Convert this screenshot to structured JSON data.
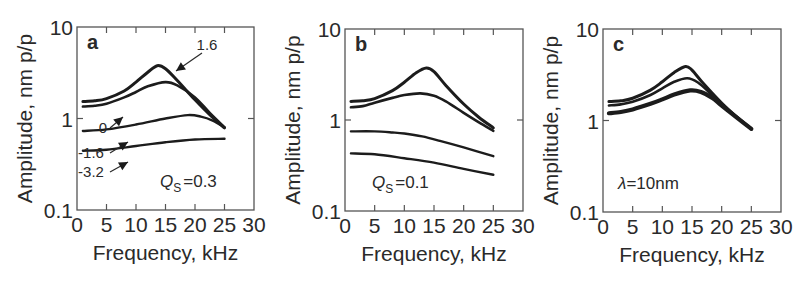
{
  "chart_data": [
    {
      "type": "line",
      "panel_label": "a",
      "xlabel": "Frequency, kHz",
      "ylabel": "Amplitude, nm p/p",
      "xlim": [
        0,
        30
      ],
      "ylim": [
        0.1,
        10
      ],
      "yscale": "log",
      "xticks": [
        "0",
        "5",
        "10",
        "15",
        "20",
        "25",
        "30"
      ],
      "yticks": [
        "0.1",
        "1",
        "10"
      ],
      "parameter_text": {
        "symbol": "Q",
        "subscript": "S",
        "value": "=0.3"
      },
      "series": [
        {
          "name": "1.6",
          "x": [
            1,
            3,
            5,
            8,
            10,
            12,
            13.6,
            15,
            17,
            20,
            22.5,
            25
          ],
          "y": [
            1.53,
            1.56,
            1.65,
            2.0,
            2.5,
            3.2,
            3.78,
            3.5,
            2.6,
            1.6,
            1.1,
            0.79
          ]
        },
        {
          "name": "0",
          "x": [
            1,
            3,
            5,
            8,
            10,
            12,
            15,
            17,
            20,
            22.5,
            25
          ],
          "y": [
            1.35,
            1.38,
            1.45,
            1.7,
            1.95,
            2.25,
            2.5,
            2.3,
            1.7,
            1.15,
            0.8
          ]
        },
        {
          "name": "-1.6",
          "x": [
            1,
            5,
            10,
            15,
            18.8,
            21,
            23,
            25
          ],
          "y": [
            0.73,
            0.76,
            0.86,
            1.0,
            1.09,
            1.05,
            0.95,
            0.8
          ]
        },
        {
          "name": "-3.2",
          "x": [
            1,
            5,
            10,
            15,
            20,
            25
          ],
          "y": [
            0.445,
            0.455,
            0.5,
            0.55,
            0.59,
            0.6
          ]
        }
      ],
      "annotations": [
        {
          "text": "1.6",
          "points_to_series": "1.6"
        },
        {
          "text": "0",
          "points_to_series": "0"
        },
        {
          "text": "-1.6",
          "points_to_series": "-1.6"
        },
        {
          "text": "-3.2",
          "points_to_series": "-3.2"
        }
      ]
    },
    {
      "type": "line",
      "panel_label": "b",
      "xlabel": "Frequency, kHz",
      "ylabel": "Amplitude, nm p/p",
      "xlim": [
        0,
        30
      ],
      "ylim": [
        0.1,
        10
      ],
      "yscale": "log",
      "xticks": [
        "0",
        "5",
        "10",
        "15",
        "20",
        "25",
        "30"
      ],
      "yticks": [
        "0.1",
        "1",
        "10"
      ],
      "parameter_text": {
        "symbol": "Q",
        "subscript": "S",
        "value": "=0.1"
      },
      "series": [
        {
          "name": "curve-1",
          "x": [
            1,
            3,
            5,
            8,
            10,
            12,
            13.7,
            15,
            17,
            20,
            22.5,
            25
          ],
          "y": [
            1.6,
            1.63,
            1.72,
            2.1,
            2.6,
            3.3,
            3.72,
            3.4,
            2.4,
            1.5,
            1.08,
            0.82
          ]
        },
        {
          "name": "curve-2",
          "x": [
            1,
            3,
            5,
            8,
            10,
            12.7,
            15,
            17,
            20,
            22.5,
            25
          ],
          "y": [
            1.38,
            1.42,
            1.55,
            1.75,
            1.88,
            1.96,
            1.85,
            1.6,
            1.2,
            0.95,
            0.76
          ]
        },
        {
          "name": "curve-3",
          "x": [
            1,
            5,
            8,
            10,
            13,
            16,
            20,
            25
          ],
          "y": [
            0.75,
            0.75,
            0.73,
            0.71,
            0.66,
            0.59,
            0.5,
            0.4
          ]
        },
        {
          "name": "curve-4",
          "x": [
            1,
            5,
            10,
            15,
            20,
            25
          ],
          "y": [
            0.43,
            0.42,
            0.38,
            0.34,
            0.29,
            0.25
          ]
        }
      ]
    },
    {
      "type": "line",
      "panel_label": "c",
      "xlabel": "Frequency, kHz",
      "ylabel": "Amplitude, nm p/p",
      "xlim": [
        0,
        30
      ],
      "ylim": [
        0.1,
        10
      ],
      "yscale": "log",
      "xticks": [
        "0",
        "5",
        "10",
        "15",
        "20",
        "25",
        "30"
      ],
      "yticks": [
        "0.1",
        "1",
        "10"
      ],
      "parameter_text": {
        "symbol": "λ",
        "subscript": "",
        "value": "=10nm"
      },
      "series": [
        {
          "name": "curve-1",
          "x": [
            1,
            3,
            5,
            8,
            10,
            12,
            13.9,
            15,
            17,
            20,
            22.5,
            25
          ],
          "y": [
            1.61,
            1.64,
            1.75,
            2.15,
            2.65,
            3.35,
            3.9,
            3.55,
            2.5,
            1.55,
            1.1,
            0.81
          ]
        },
        {
          "name": "curve-2",
          "x": [
            1,
            3,
            5,
            8,
            10,
            12,
            14.2,
            16,
            18,
            20,
            22.5,
            25
          ],
          "y": [
            1.46,
            1.5,
            1.6,
            1.9,
            2.25,
            2.65,
            2.9,
            2.6,
            2.0,
            1.5,
            1.1,
            0.81
          ]
        },
        {
          "name": "curve-3",
          "x": [
            1,
            3,
            5,
            8,
            10,
            12,
            14.7,
            16.5,
            18.5,
            20,
            22.5,
            25
          ],
          "y": [
            1.2,
            1.24,
            1.32,
            1.52,
            1.7,
            1.92,
            2.13,
            2.05,
            1.75,
            1.45,
            1.08,
            0.81
          ]
        }
      ]
    }
  ]
}
